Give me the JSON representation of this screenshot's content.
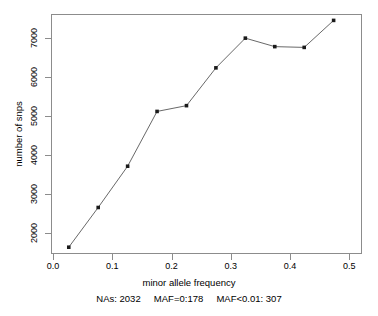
{
  "chart_data": {
    "type": "line",
    "title": "",
    "xlabel": "minor allele frequency",
    "ylabel": "number of snps",
    "caption": "NAs: 2032     MAF=0:178     MAF<0.01: 307",
    "x": [
      0.025,
      0.075,
      0.125,
      0.175,
      0.225,
      0.275,
      0.325,
      0.375,
      0.425,
      0.475
    ],
    "values": [
      1600,
      2630,
      3700,
      5120,
      5270,
      6250,
      7020,
      6800,
      6780,
      7480
    ],
    "series": [
      {
        "name": "number of snps",
        "values": [
          1600,
          2630,
          3700,
          5120,
          5270,
          6250,
          7020,
          6800,
          6780,
          7480
        ]
      }
    ],
    "xlim": [
      -0.0035,
      0.5215
    ],
    "ylim": [
      1450,
      7620
    ],
    "xticks": [
      0.0,
      0.1,
      0.2,
      0.3,
      0.4,
      0.5
    ],
    "xtick_labels": [
      "0.0",
      "0.1",
      "0.2",
      "0.3",
      "0.4",
      "0.5"
    ],
    "yticks": [
      2000,
      3000,
      4000,
      5000,
      6000,
      7000
    ],
    "ytick_labels": [
      "2000",
      "3000",
      "4000",
      "5000",
      "6000",
      "7000"
    ],
    "grid": false,
    "legend": "none",
    "line_color": "#555555",
    "marker_color": "#1a1a1a",
    "marker": "square",
    "box_color": "#8c8c8c"
  },
  "annotations": {
    "nas_label": "NAs: 2032",
    "maf_zero_label": "MAF=0:178",
    "maf_rare_label": "MAF<0.01: 307"
  }
}
